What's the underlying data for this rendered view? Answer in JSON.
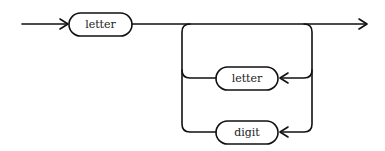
{
  "diagram": {
    "type": "syntax-diagram",
    "nodes": [
      {
        "id": "n1",
        "label": "letter"
      },
      {
        "id": "n2",
        "label": "letter"
      },
      {
        "id": "n3",
        "label": "digit"
      }
    ]
  }
}
